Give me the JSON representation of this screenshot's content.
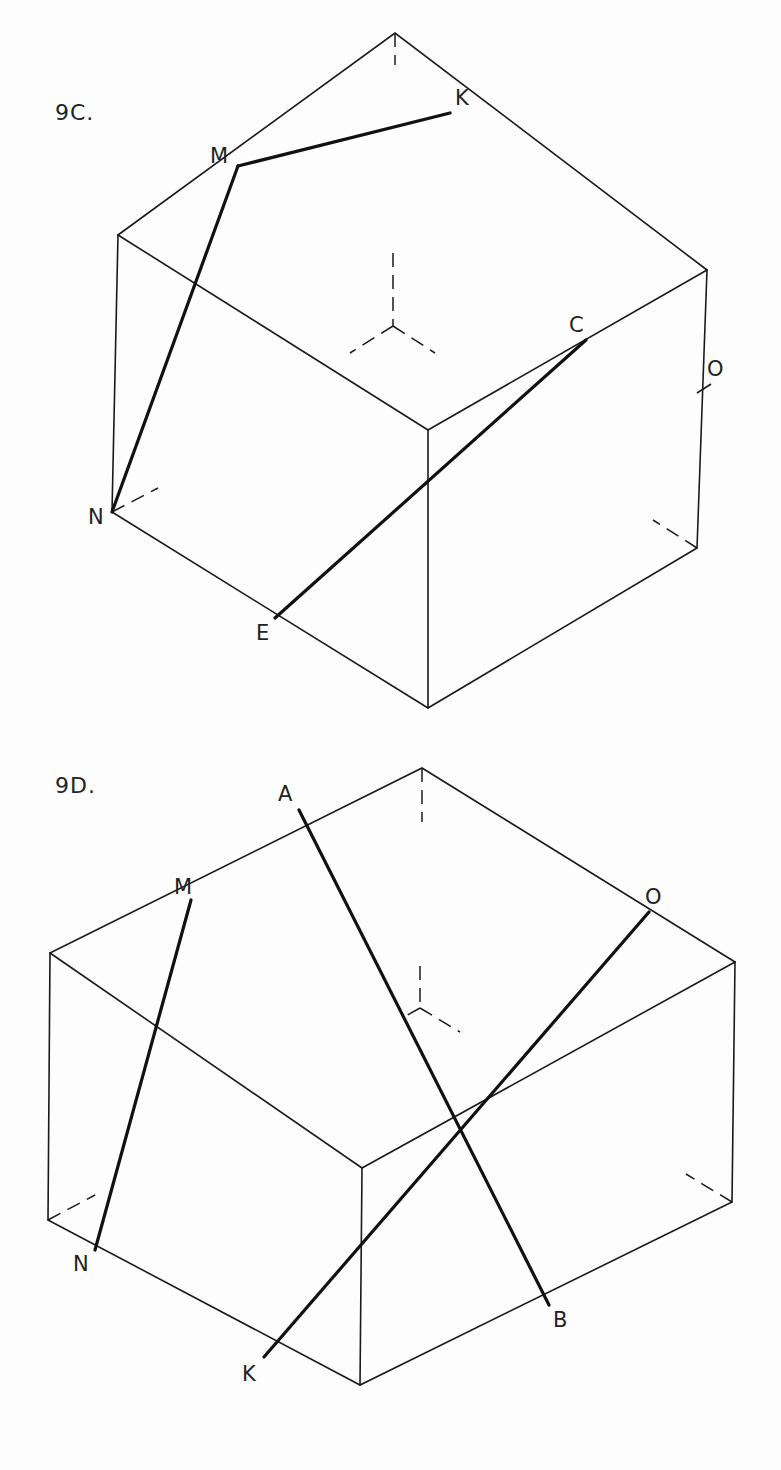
{
  "figures": [
    {
      "id": "9C",
      "title": "9C.",
      "points": {
        "K": "K",
        "M": "M",
        "C": "C",
        "O": "O",
        "N": "N",
        "E": "E"
      },
      "bold_segments": [
        "M-K",
        "M-N",
        "E-C"
      ]
    },
    {
      "id": "9D",
      "title": "9D.",
      "points": {
        "A": "A",
        "M": "M",
        "O": "O",
        "N": "N",
        "K": "K",
        "B": "B"
      },
      "bold_segments": [
        "M-N",
        "A-B",
        "K-O"
      ]
    }
  ],
  "colors": {
    "line": "#1a1a1a",
    "background": "#fdfdfd"
  }
}
